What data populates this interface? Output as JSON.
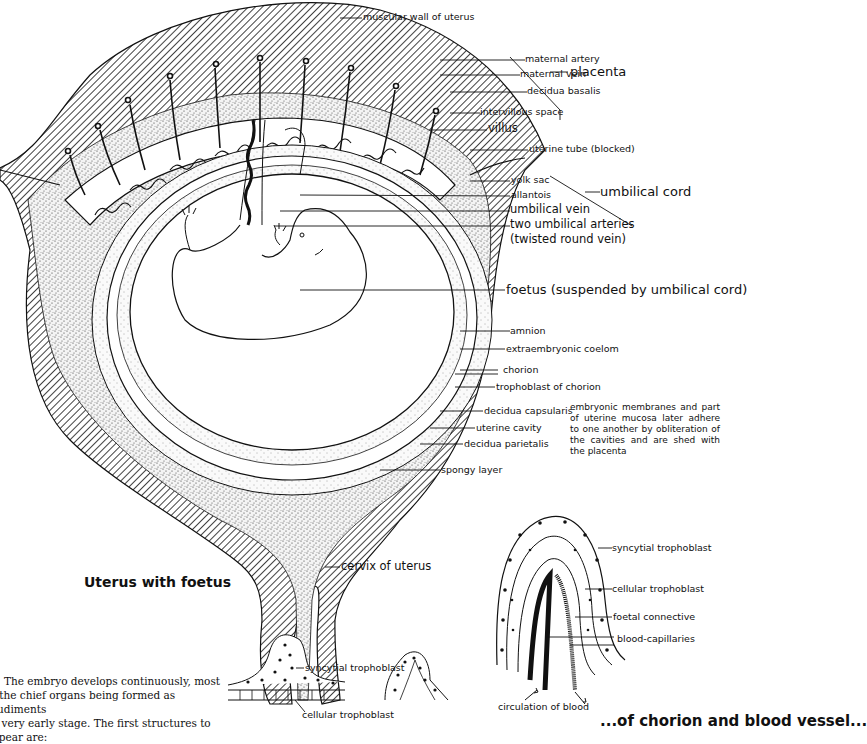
{
  "figure": {
    "title": "Uterus with foetus",
    "bottom_caption_partial": "...of chorion and blood vessel...",
    "main_labels": {
      "muscular_wall": "muscular wall of uterus",
      "maternal_artery": "maternal artery",
      "maternal_vein": "maternal vein",
      "decidua_basalis": "decidua basalis",
      "intervillous_space": "intervillous space",
      "villus": "villus",
      "placenta": "placenta",
      "uterine_tube": "uterine tube (blocked)",
      "yolk_sac": "yolk sac",
      "allantois": "allantois",
      "umbilical_cord": "umbilical cord",
      "umbilical_vein": "umbilical vein",
      "umbilical_arteries_line1": "two umbilical arteries",
      "umbilical_arteries_line2": "(twisted round vein)",
      "foetus": "foetus (suspended by umbilical cord)",
      "amnion": "amnion",
      "extraembryonic_coelom": "extraembryonic coelom",
      "chorion": "chorion",
      "trophoblast_of_chorion": "trophoblast of chorion",
      "decidua_capsularis": "decidua capsularis",
      "uterine_cavity": "uterine cavity",
      "decidua_parietalis": "decidua parietalis",
      "spongy_layer": "spongy layer",
      "cervix": "cervix of uterus"
    },
    "side_note": "embryonic membranes and part of uterine mucosa later adhere to one another by obliteration of the cavities and are shed with the placenta",
    "villus_detail_labels": {
      "syncytial_trophoblast": "syncytial trophoblast",
      "cellular_trophoblast": "cellular trophoblast",
      "foetal_connective": "foetal connective",
      "blood_capillaries": "blood-capillaries",
      "circulation": "circulation of blood"
    },
    "small_villus_labels": {
      "syncytial_trophoblast": "syncytial trophoblast",
      "cellular_trophoblast": "cellular trophoblast"
    },
    "body_text": [
      "The embryo develops continuously, most",
      "f the chief organs being formed as rudiments",
      " a very early stage.  The first structures to",
      "ppear are:"
    ]
  }
}
